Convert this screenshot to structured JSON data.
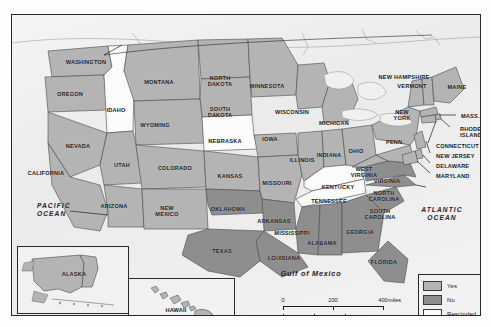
{
  "map": {
    "title": "United States ratification status map",
    "oceans": [
      {
        "name": "pacific-ocean",
        "text": "PACIFIC\nOCEAN",
        "x": 36,
        "y": 209
      },
      {
        "name": "atlantic-ocean",
        "text": "ATLANTIC\nOCEAN",
        "x": 441,
        "y": 213
      }
    ],
    "gulf": {
      "text": "Gulf of Mexico",
      "x": 310,
      "y": 272
    },
    "states": [
      {
        "id": "washington",
        "label": "WASHINGTON",
        "status": "Yes",
        "x": 74,
        "y": 47
      },
      {
        "id": "oregon",
        "label": "OREGON",
        "status": "Yes",
        "x": 58,
        "y": 79
      },
      {
        "id": "idaho",
        "label": "IDAHO",
        "status": "Rescinded",
        "x": 104,
        "y": 95
      },
      {
        "id": "montana",
        "label": "MONTANA",
        "status": "Yes",
        "x": 147,
        "y": 67
      },
      {
        "id": "north-dakota",
        "label": "NORTH\nDAKOTA",
        "status": "Yes",
        "x": 208,
        "y": 66
      },
      {
        "id": "south-dakota",
        "label": "SOUTH\nDAKOTA",
        "status": "Yes",
        "x": 208,
        "y": 97
      },
      {
        "id": "minnesota",
        "label": "MINNESOTA",
        "status": "Yes",
        "x": 255,
        "y": 71
      },
      {
        "id": "wisconsin",
        "label": "WISCONSIN",
        "status": "Yes",
        "x": 280,
        "y": 97
      },
      {
        "id": "michigan",
        "label": "MICHIGAN",
        "status": "Yes",
        "x": 322,
        "y": 108
      },
      {
        "id": "wyoming",
        "label": "WYOMING",
        "status": "Yes",
        "x": 143,
        "y": 110
      },
      {
        "id": "nebraska",
        "label": "NEBRASKA",
        "status": "Rescinded",
        "x": 213,
        "y": 126
      },
      {
        "id": "iowa",
        "label": "IOWA",
        "status": "Yes",
        "x": 258,
        "y": 124
      },
      {
        "id": "nevada",
        "label": "NEVADA",
        "status": "Yes",
        "x": 66,
        "y": 131
      },
      {
        "id": "utah",
        "label": "UTAH",
        "status": "Yes",
        "x": 110,
        "y": 150
      },
      {
        "id": "colorado",
        "label": "COLORADO",
        "status": "Yes",
        "x": 163,
        "y": 153
      },
      {
        "id": "kansas",
        "label": "KANSAS",
        "status": "Yes",
        "x": 218,
        "y": 161
      },
      {
        "id": "missouri",
        "label": "MISSOURI",
        "status": "Yes",
        "x": 265,
        "y": 168
      },
      {
        "id": "illinois",
        "label": "ILLINOIS",
        "status": "Yes",
        "x": 290,
        "y": 145
      },
      {
        "id": "indiana",
        "label": "INDIANA",
        "status": "Yes",
        "x": 317,
        "y": 140
      },
      {
        "id": "ohio",
        "label": "OHIO",
        "status": "Yes",
        "x": 344,
        "y": 136
      },
      {
        "id": "california",
        "label": "CALIFORNIA",
        "status": "Yes",
        "x": 34,
        "y": 158
      },
      {
        "id": "arizona",
        "label": "ARIZONA",
        "status": "Yes",
        "x": 102,
        "y": 191
      },
      {
        "id": "new-mexico",
        "label": "NEW\nMEXICO",
        "status": "Yes",
        "x": 155,
        "y": 196
      },
      {
        "id": "oklahoma",
        "label": "OKLAHOMA",
        "status": "No",
        "x": 216,
        "y": 194
      },
      {
        "id": "arkansas",
        "label": "ARKANSAS",
        "status": "No",
        "x": 262,
        "y": 206
      },
      {
        "id": "kentucky",
        "label": "KENTUCKY",
        "status": "Rescinded",
        "x": 326,
        "y": 172
      },
      {
        "id": "tennessee",
        "label": "TENNESSEE",
        "status": "Rescinded",
        "x": 317,
        "y": 186
      },
      {
        "id": "mississippi",
        "label": "MISSISSIPPI",
        "status": "No",
        "x": 280,
        "y": 218
      },
      {
        "id": "alabama",
        "label": "ALABAMA",
        "status": "No",
        "x": 310,
        "y": 228
      },
      {
        "id": "georgia",
        "label": "GEORGIA",
        "status": "No",
        "x": 348,
        "y": 217
      },
      {
        "id": "south-carolina",
        "label": "SOUTH\nCAROLINA",
        "status": "No",
        "x": 368,
        "y": 199
      },
      {
        "id": "north-carolina",
        "label": "NORTH\nCAROLINA",
        "status": "No",
        "x": 372,
        "y": 181
      },
      {
        "id": "virginia",
        "label": "VIRGINIA",
        "status": "No",
        "x": 375,
        "y": 166
      },
      {
        "id": "west-virginia",
        "label": "WEST\nVIRGINIA",
        "status": "Yes",
        "x": 352,
        "y": 157
      },
      {
        "id": "louisiana",
        "label": "LOUISIANA",
        "status": "No",
        "x": 272,
        "y": 243
      },
      {
        "id": "texas",
        "label": "TEXAS",
        "status": "No",
        "x": 210,
        "y": 236
      },
      {
        "id": "florida",
        "label": "FLORIDA",
        "status": "No",
        "x": 372,
        "y": 247
      },
      {
        "id": "pennsylvania",
        "label": "PENN.",
        "status": "Yes",
        "x": 383,
        "y": 127
      },
      {
        "id": "new-york",
        "label": "NEW\nYORK",
        "status": "Yes",
        "x": 390,
        "y": 100
      },
      {
        "id": "vermont",
        "label": "VERMONT",
        "status": "Yes",
        "x": 400,
        "y": 71
      },
      {
        "id": "new-hampshire",
        "label": "NEW HAMPSHIRE",
        "status": "Yes",
        "x": 392,
        "y": 62
      },
      {
        "id": "maine",
        "label": "MAINE",
        "status": "Yes",
        "x": 445,
        "y": 72
      },
      {
        "id": "alaska",
        "label": "ALASKA",
        "status": "Yes",
        "x": 61,
        "y": 258
      },
      {
        "id": "hawaii",
        "label": "HAWAII",
        "status": "Yes",
        "x": 163,
        "y": 294
      }
    ],
    "callouts": [
      {
        "id": "massachusetts",
        "label": "MASS.",
        "status": "Yes",
        "x": 449,
        "y": 101
      },
      {
        "id": "rhode-island",
        "label": "RHODE\nISLAND",
        "status": "Yes",
        "x": 448,
        "y": 117
      },
      {
        "id": "connecticut",
        "label": "CONNECTICUT",
        "status": "Yes",
        "x": 424,
        "y": 131
      },
      {
        "id": "new-jersey",
        "label": "NEW JERSEY",
        "status": "Yes",
        "x": 424,
        "y": 141
      },
      {
        "id": "delaware",
        "label": "DELAWARE",
        "status": "Yes",
        "x": 424,
        "y": 151
      },
      {
        "id": "maryland",
        "label": "MARYLAND",
        "status": "Yes",
        "x": 424,
        "y": 161
      }
    ]
  },
  "legend": {
    "items": [
      {
        "label": "Yes",
        "color": "#b4b4b4"
      },
      {
        "label": "No",
        "color": "#8e8e8e"
      },
      {
        "label": "Rescinded",
        "color": "#fbfbfb"
      }
    ]
  },
  "scale": {
    "miles": {
      "ticks": [
        "0",
        "200",
        "400"
      ],
      "unit": "miles"
    },
    "kilometers": {
      "ticks": [
        "0",
        "200",
        "400"
      ],
      "unit": "kilometers"
    }
  },
  "insets": [
    {
      "id": "alaska-inset",
      "label": "ALASKA"
    },
    {
      "id": "hawaii-inset",
      "label": "HAWAII"
    }
  ]
}
